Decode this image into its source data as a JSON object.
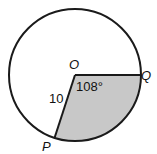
{
  "diagram": {
    "center_label": "O",
    "point_q_label": "Q",
    "point_p_label": "P",
    "radius_label": "10",
    "angle_label": "108°",
    "colors": {
      "shade": "#c8c8c8",
      "stroke": "#1a1a1a",
      "background": "#ffffff"
    }
  }
}
